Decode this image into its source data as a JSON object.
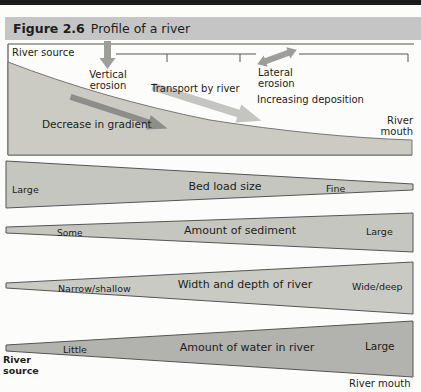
{
  "header": {
    "figure_label": "Figure 2.6",
    "title": "Profile of a river"
  },
  "profile": {
    "river_source_label": "River source",
    "vertical_erosion_label": "Vertical erosion",
    "transport_label": "Transport by river",
    "lateral_erosion_label": "Lateral erosion",
    "deposition_label": "Increasing deposition",
    "gradient_label": "Decrease in gradient",
    "river_mouth_label": "River mouth"
  },
  "wedges": [
    {
      "name": "Bed load size",
      "left_label": "Large",
      "right_label": "Fine",
      "trend": "decreases downstream"
    },
    {
      "name": "Amount of sediment",
      "left_label": "Some",
      "right_label": "Large",
      "trend": "increases downstream"
    },
    {
      "name": "Width and depth of river",
      "left_label": "Narrow/shallow",
      "right_label": "Wide/deep",
      "trend": "increases downstream"
    },
    {
      "name": "Amount of water in river",
      "left_label": "Little",
      "right_label": "Large",
      "trend": "increases downstream"
    }
  ],
  "footer": {
    "river_source": "River source",
    "river_mouth": "River mouth"
  },
  "colors": {
    "top_bar": "#1b1b1b",
    "header_bg": "#c5c5c5",
    "outline": "#555555",
    "profile_fill": "#cbcbc4",
    "bed_load_fill": "#c6c6c0",
    "sediment_fill": "#c6c6c0",
    "width_depth_fill": "#cacac4",
    "water_fill": "#b2b2ae",
    "erosion_arrow": "#9d9d99",
    "transport_arrow": "#bcbcb8",
    "gradient_arrow": "#8d8d89"
  }
}
